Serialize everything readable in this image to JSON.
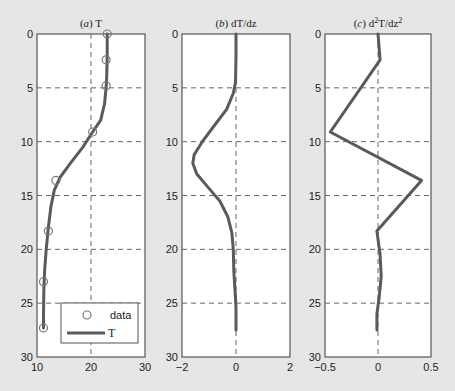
{
  "chart_data": [
    {
      "type": "line",
      "panel": "a",
      "title": "(a) T",
      "title_prefix": "(",
      "title_letter": "a",
      "title_suffix": ") T",
      "xlim": [
        10,
        30
      ],
      "ylim": [
        30,
        0
      ],
      "xticks": [
        "10",
        "20",
        "30"
      ],
      "yticks": [
        "0",
        "5",
        "10",
        "15",
        "20",
        "25",
        "30"
      ],
      "grid": "dashed",
      "legend": {
        "position": "lower right",
        "entries": [
          "data",
          "T"
        ]
      },
      "series": [
        {
          "name": "data",
          "style": "circle markers",
          "x": [
            23.0,
            22.8,
            22.8,
            20.3,
            13.5,
            12.1,
            11.2,
            11.2
          ],
          "depth": [
            0,
            2.4,
            4.8,
            9.1,
            13.6,
            18.3,
            23.0,
            27.3
          ]
        },
        {
          "name": "T",
          "style": "solid line",
          "x": [
            23.0,
            23.0,
            22.9,
            22.8,
            22.5,
            21.8,
            20.3,
            18.5,
            16.2,
            14.3,
            13.2,
            12.6,
            12.1,
            11.7,
            11.4,
            11.25,
            11.2,
            11.2
          ],
          "depth": [
            0,
            2,
            4,
            5,
            6.5,
            8,
            9.1,
            10.5,
            12,
            13.3,
            14.5,
            16,
            18,
            20,
            22,
            24,
            26,
            27.3
          ]
        }
      ]
    },
    {
      "type": "line",
      "panel": "b",
      "title": "(b) dT/dz",
      "title_prefix": "(",
      "title_letter": "b",
      "title_suffix": ") dT/dz",
      "xlim": [
        -2,
        2
      ],
      "ylim": [
        30,
        0
      ],
      "xticks": [
        "-2",
        "0",
        "2"
      ],
      "yticks": [
        "0",
        "5",
        "10",
        "15",
        "20",
        "25",
        "30"
      ],
      "grid": "dashed",
      "series": [
        {
          "name": "dT/dz",
          "style": "solid line",
          "x": [
            0,
            0,
            -0.02,
            -0.1,
            -0.35,
            -0.8,
            -1.25,
            -1.55,
            -1.6,
            -1.45,
            -1.05,
            -0.6,
            -0.3,
            -0.15,
            -0.1,
            -0.08,
            -0.02,
            0,
            0
          ],
          "depth": [
            0,
            2,
            4.5,
            5.5,
            7,
            8.5,
            10,
            11.2,
            12,
            13,
            14.2,
            15.5,
            17,
            18.5,
            20,
            22,
            24.5,
            25.5,
            27.5
          ]
        }
      ]
    },
    {
      "type": "line",
      "panel": "c",
      "title": "(c) d²T/dz²",
      "title_prefix": "(",
      "title_letter": "c",
      "title_suffix": ") d",
      "title_sup1": "2",
      "title_mid": "T/dz",
      "title_sup2": "2",
      "xlim": [
        -0.5,
        0.5
      ],
      "ylim": [
        30,
        0
      ],
      "xticks": [
        "-0.5",
        "0",
        "0.5"
      ],
      "yticks": [
        "0",
        "5",
        "10",
        "15",
        "20",
        "25",
        "30"
      ],
      "grid": "dashed",
      "series": [
        {
          "name": "d2T/dz2",
          "style": "solid line",
          "x": [
            0,
            0.02,
            -0.45,
            0.41,
            -0.01,
            0.02,
            0.03,
            0.01,
            -0.01,
            -0.01
          ],
          "depth": [
            0,
            2.4,
            9.1,
            13.6,
            18.3,
            20.5,
            22.5,
            24.5,
            26,
            27.5
          ]
        }
      ]
    }
  ]
}
